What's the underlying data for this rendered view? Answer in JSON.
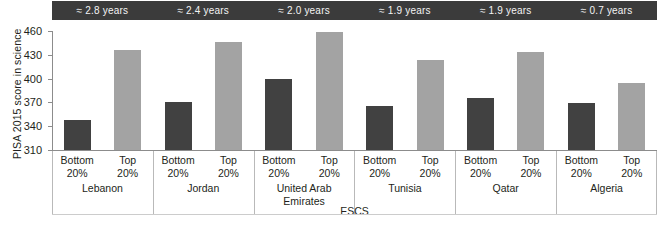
{
  "chart_data": {
    "type": "bar",
    "title": "",
    "xlabel": "ESCS",
    "ylabel": "PISA 2015 score in science",
    "ylim": [
      310,
      460
    ],
    "yticks": [
      460,
      430,
      400,
      370,
      340,
      310
    ],
    "grid": false,
    "legend_position": "none",
    "categories": [
      "Lebanon",
      "Jordan",
      "United Arab Emirates",
      "Tunisia",
      "Qatar",
      "Algeria"
    ],
    "subcategories": [
      "Bottom 20%",
      "Top 20%"
    ],
    "series": [
      {
        "name": "Bottom 20%",
        "color": "#414141",
        "values": [
          348,
          371,
          399,
          365,
          375,
          369
        ]
      },
      {
        "name": "Top 20%",
        "color": "#a3a3a3",
        "values": [
          436,
          446,
          459,
          424,
          433,
          394
        ]
      }
    ],
    "annotations": {
      "label": "approximate schooling-year gap per country",
      "values": [
        "≈ 2.8 years",
        "≈ 2.4 years",
        "≈ 2.0 years",
        "≈ 1.9 years",
        "≈ 1.9 years",
        "≈ 0.7 years"
      ]
    }
  },
  "axes": {
    "y_title": "PISA 2015 score in science",
    "x_title": "ESCS",
    "y_ticks": [
      "460",
      "430",
      "400",
      "370",
      "340",
      "310"
    ]
  },
  "banner": {
    "cells": [
      "≈ 2.8 years",
      "≈ 2.4 years",
      "≈ 2.0 years",
      "≈ 1.9 years",
      "≈ 1.9 years",
      "≈ 0.7 years"
    ],
    "background": "#3b3b3b",
    "text_color": "#f3f3f3"
  },
  "groups": [
    {
      "country": "Lebanon",
      "country_line2": "",
      "bottom_label_l1": "Bottom",
      "bottom_label_l2": "20%",
      "top_label_l1": "Top",
      "top_label_l2": "20%"
    },
    {
      "country": "Jordan",
      "country_line2": "",
      "bottom_label_l1": "Bottom",
      "bottom_label_l2": "20%",
      "top_label_l1": "Top",
      "top_label_l2": "20%"
    },
    {
      "country": "United Arab",
      "country_line2": "Emirates",
      "bottom_label_l1": "Bottom",
      "bottom_label_l2": "20%",
      "top_label_l1": "Top",
      "top_label_l2": "20%"
    },
    {
      "country": "Tunisia",
      "country_line2": "",
      "bottom_label_l1": "Bottom",
      "bottom_label_l2": "20%",
      "top_label_l1": "Top",
      "top_label_l2": "20%"
    },
    {
      "country": "Qatar",
      "country_line2": "",
      "bottom_label_l1": "Bottom",
      "bottom_label_l2": "20%",
      "top_label_l1": "Top",
      "top_label_l2": "20%"
    },
    {
      "country": "Algeria",
      "country_line2": "",
      "bottom_label_l1": "Bottom",
      "bottom_label_l2": "20%",
      "top_label_l1": "Top",
      "top_label_l2": "20%"
    }
  ],
  "colors": {
    "bar_bottom": "#414141",
    "bar_top": "#a3a3a3",
    "axis": "#8c8c8c",
    "separator": "#b9b9b9",
    "banner_bg": "#3b3b3b"
  }
}
